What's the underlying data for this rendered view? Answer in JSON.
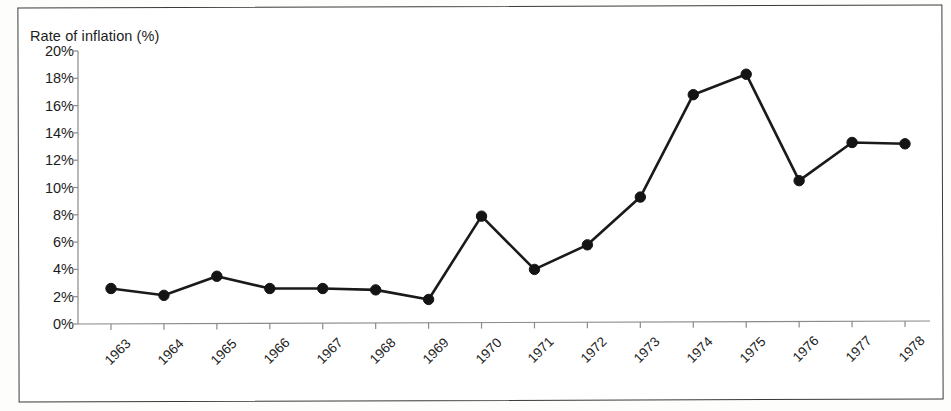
{
  "chart_data": {
    "type": "line",
    "title": "Rate of inflation (%)",
    "xlabel": "",
    "ylabel": "Rate of inflation (%)",
    "categories": [
      "1963",
      "1964",
      "1965",
      "1966",
      "1967",
      "1968",
      "1969",
      "1970",
      "1971",
      "1972",
      "1973",
      "1974",
      "1975",
      "1976",
      "1977",
      "1978"
    ],
    "values": [
      2.6,
      2.1,
      3.5,
      2.6,
      2.6,
      2.5,
      1.8,
      7.9,
      4.0,
      5.8,
      9.3,
      16.8,
      18.3,
      10.5,
      13.3,
      13.2
    ],
    "series": [
      {
        "name": "Rate of inflation",
        "values": [
          2.6,
          2.1,
          3.5,
          2.6,
          2.6,
          2.5,
          1.8,
          7.9,
          4.0,
          5.8,
          9.3,
          16.8,
          18.3,
          10.5,
          13.3,
          13.2
        ]
      }
    ],
    "ylim": [
      0,
      20
    ],
    "ytick_values": [
      0,
      2,
      4,
      6,
      8,
      10,
      12,
      14,
      16,
      18,
      20
    ],
    "ytick_labels": [
      "0%",
      "2%",
      "4%",
      "6%",
      "8%",
      "10%",
      "12%",
      "14%",
      "16%",
      "18%",
      "20%"
    ],
    "grid": false,
    "legend": "none",
    "marker": "filled-circle",
    "line_color": "#141414",
    "marker_color": "#141414",
    "axis_color": "#8a8a8a",
    "xtick_rotation": -45,
    "background_color": "#ffffff",
    "border_color": "#3a3a3a"
  }
}
